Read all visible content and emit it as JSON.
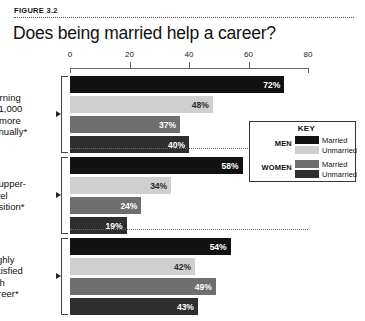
{
  "figure": {
    "number": "FIGURE 3.2",
    "title": "Does being married help a career?"
  },
  "legend": {
    "title": "KEY",
    "groups": [
      {
        "label": "MEN",
        "entries": [
          {
            "text": "Married",
            "color": "#111111"
          },
          {
            "text": "Unmarried",
            "color": "#cfcfcf"
          }
        ]
      },
      {
        "label": "WOMEN",
        "entries": [
          {
            "text": "Married",
            "color": "#6e6e6e"
          },
          {
            "text": "Unmarried",
            "color": "#2e2e2e"
          }
        ]
      }
    ]
  },
  "chart_data": {
    "type": "bar",
    "orientation": "horizontal",
    "title": "Does being married help a career?",
    "xlabel": "",
    "ylabel": "",
    "xlim": [
      0,
      80
    ],
    "ticks": [
      "0",
      "20",
      "40",
      "60",
      "80"
    ],
    "tick_values": [
      0,
      20,
      40,
      60,
      80
    ],
    "grid": false,
    "legend_position": "inside-right",
    "categories": [
      "Earning $71,000 or more annually*",
      "In upper-level position*",
      "Highly satisfied with career*"
    ],
    "category_lines": [
      [
        "Earning",
        "$71,000",
        "or more",
        "annually*"
      ],
      [
        "In upper-",
        "level",
        "position*"
      ],
      [
        "Highly",
        "satisfied",
        "with",
        "career*"
      ]
    ],
    "series": [
      {
        "name": "Married men",
        "color": "#111111",
        "label_on": "dark",
        "values": [
          72,
          58,
          54
        ]
      },
      {
        "name": "Unmarried men",
        "color": "#cfcfcf",
        "label_on": "light",
        "values": [
          48,
          34,
          42
        ]
      },
      {
        "name": "Married women",
        "color": "#6e6e6e",
        "label_on": "dark",
        "values": [
          37,
          24,
          49
        ]
      },
      {
        "name": "Unmarried women",
        "color": "#2e2e2e",
        "label_on": "dark",
        "values": [
          40,
          19,
          43
        ]
      }
    ],
    "value_labels": [
      [
        "72%",
        "48%",
        "37%",
        "40%"
      ],
      [
        "58%",
        "34%",
        "24%",
        "19%"
      ],
      [
        "54%",
        "42%",
        "49%",
        "43%"
      ]
    ]
  },
  "axis_geometry": {
    "x0_px": 70,
    "x_end_px": 308,
    "px_per_unit": 2.975,
    "group_tops": [
      76,
      157,
      238
    ],
    "bar_height": 17,
    "bar_gap": 3,
    "separator_ys": [
      148,
      229
    ]
  }
}
